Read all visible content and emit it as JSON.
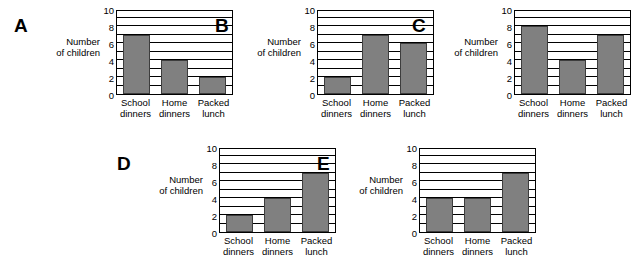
{
  "figure": {
    "axis_title_line1": "Number",
    "axis_title_line2": "of children",
    "bar_color": "#808080",
    "bar_border_color": "#3d3d3d",
    "background": "#ffffff",
    "categories": [
      {
        "line1": "School",
        "line2": "dinners"
      },
      {
        "line1": "Home",
        "line2": "dinners"
      },
      {
        "line1": "Packed",
        "line2": "lunch"
      }
    ],
    "y_tick_labels": [
      "0",
      "2",
      "4",
      "6",
      "8",
      "10"
    ]
  },
  "chart_data": [
    {
      "type": "bar",
      "title": "A",
      "categories": [
        "School dinners",
        "Home dinners",
        "Packed lunch"
      ],
      "values": [
        7,
        4,
        2
      ],
      "xlabel": "",
      "ylabel": "Number of children",
      "ylim": [
        0,
        10
      ],
      "yticks": [
        0,
        2,
        4,
        6,
        8,
        10
      ],
      "grid": true,
      "gridline_interval": 1,
      "legend": "none"
    },
    {
      "type": "bar",
      "title": "B",
      "categories": [
        "School dinners",
        "Home dinners",
        "Packed lunch"
      ],
      "values": [
        2,
        7,
        6
      ],
      "xlabel": "",
      "ylabel": "Number of children",
      "ylim": [
        0,
        10
      ],
      "yticks": [
        0,
        2,
        4,
        6,
        8,
        10
      ],
      "grid": true,
      "gridline_interval": 1,
      "legend": "none"
    },
    {
      "type": "bar",
      "title": "C",
      "categories": [
        "School dinners",
        "Home dinners",
        "Packed lunch"
      ],
      "values": [
        8,
        4,
        7
      ],
      "xlabel": "",
      "ylabel": "Number of children",
      "ylim": [
        0,
        10
      ],
      "yticks": [
        0,
        2,
        4,
        6,
        8,
        10
      ],
      "grid": true,
      "gridline_interval": 1,
      "legend": "none"
    },
    {
      "type": "bar",
      "title": "D",
      "categories": [
        "School dinners",
        "Home dinners",
        "Packed lunch"
      ],
      "values": [
        2,
        4,
        7
      ],
      "xlabel": "",
      "ylabel": "Number of children",
      "ylim": [
        0,
        10
      ],
      "yticks": [
        0,
        2,
        4,
        6,
        8,
        10
      ],
      "grid": true,
      "gridline_interval": 1,
      "legend": "none"
    },
    {
      "type": "bar",
      "title": "E",
      "categories": [
        "School dinners",
        "Home dinners",
        "Packed lunch"
      ],
      "values": [
        4,
        4,
        7
      ],
      "xlabel": "",
      "ylabel": "Number of children",
      "ylim": [
        0,
        10
      ],
      "yticks": [
        0,
        2,
        4,
        6,
        8,
        10
      ],
      "grid": true,
      "gridline_interval": 1,
      "legend": "none"
    }
  ]
}
